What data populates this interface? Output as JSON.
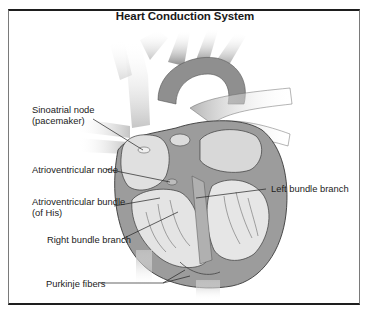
{
  "figure": {
    "title": "Heart Conduction System"
  },
  "labels": [
    {
      "id": "sinoatrial",
      "line1": "Sinoatrial node",
      "line2": "(pacemaker)"
    },
    {
      "id": "av-node",
      "line1": "Atrioventricular node"
    },
    {
      "id": "av-bundle",
      "line1": "Atrioventricular bundle",
      "line2": "(of His)"
    },
    {
      "id": "left-bundle",
      "line1": "Left bundle branch"
    },
    {
      "id": "right-bundle",
      "line1": "Right bundle branch"
    },
    {
      "id": "purkinje",
      "line1": "Purkinje fibers"
    }
  ],
  "colors": {
    "vessel_light": "#c9c9c9",
    "vessel_dark": "#8e8e8e",
    "muscle": "#9a9a9a",
    "chamber": "#e2e2e2",
    "outline": "#3a3a3a",
    "frame_dark": "#1e1e1e"
  }
}
